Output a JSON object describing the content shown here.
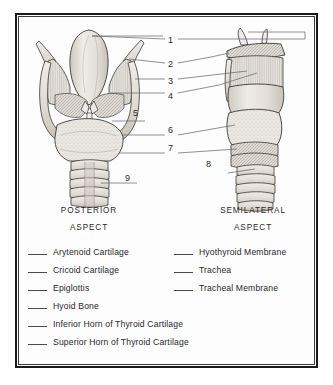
{
  "figure": {
    "views": [
      {
        "id": "posterior",
        "caption_line1": "POSTERIOR",
        "caption_line2": "ASPECT"
      },
      {
        "id": "semilateral",
        "caption_line1": "SEMILATERAL",
        "caption_line2": "ASPECT"
      }
    ],
    "callouts": [
      {
        "number": "1",
        "x": 168,
        "y": 36
      },
      {
        "number": "2",
        "x": 168,
        "y": 60
      },
      {
        "number": "3",
        "x": 168,
        "y": 77
      },
      {
        "number": "4",
        "x": 168,
        "y": 92
      },
      {
        "number": "5",
        "x": 133,
        "y": 109
      },
      {
        "number": "6",
        "x": 168,
        "y": 126
      },
      {
        "number": "7",
        "x": 168,
        "y": 144
      },
      {
        "number": "8",
        "x": 206,
        "y": 160
      },
      {
        "number": "9",
        "x": 125,
        "y": 174
      }
    ]
  },
  "answer_key": {
    "left_column": [
      {
        "label": "Arytenoid Cartilage"
      },
      {
        "label": "Cricoid Cartilage"
      },
      {
        "label": "Epiglottis"
      },
      {
        "label": "Hyoid Bone"
      },
      {
        "label": "Inferior Horn of Thyroid Cartilage"
      },
      {
        "label": "Superior Horn of Thyroid Cartilage"
      }
    ],
    "right_column": [
      {
        "label": "Hyothyroid Membrane"
      },
      {
        "label": "Trachea"
      },
      {
        "label": "Tracheal Membrane"
      }
    ]
  },
  "colors": {
    "ink": "#26282a",
    "frame": "#1a1a1a",
    "leader": "#58595b",
    "fill_light": "#f0efec",
    "fill_mid": "#ddd9d2",
    "fill_dark": "#c3bdb3"
  }
}
